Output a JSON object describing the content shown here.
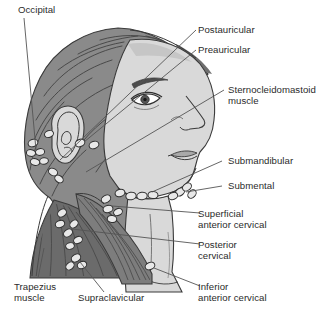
{
  "figure": {
    "background_color": "#ffffff",
    "text_color": "#2b2b2b"
  },
  "palette": {
    "hair_dark": "#6f6f6f",
    "hair_mid": "#8a8a8a",
    "skin": "#d9d9d9",
    "skin_shadow": "#c6c6c6",
    "muscle_dark": "#6b6b6b",
    "muscle_mid": "#7d7d7d",
    "node_fill": "#e8e8e8",
    "outline": "#3a3a3a",
    "leader_line": "#555555",
    "lip": "#a9a9a9",
    "white": "#ffffff"
  },
  "labels": [
    {
      "id": "occipital",
      "text": "Occipital",
      "lines": [
        "Occipital"
      ]
    },
    {
      "id": "postauricular",
      "text": "Postauricular",
      "lines": [
        "Postauricular"
      ]
    },
    {
      "id": "preauricular",
      "text": "Preauricular",
      "lines": [
        "Preauricular"
      ]
    },
    {
      "id": "sternocleidomastoid",
      "text": "Sternocleidomastoid muscle",
      "lines": [
        "Sternocleidomastoid",
        "muscle"
      ]
    },
    {
      "id": "submandibular",
      "text": "Submandibular",
      "lines": [
        "Submandibular"
      ]
    },
    {
      "id": "submental",
      "text": "Submental",
      "lines": [
        "Submental"
      ]
    },
    {
      "id": "superficial-anterior-cervical",
      "text": "Superficial anterior cervical",
      "lines": [
        "Superficial",
        "anterior cervical"
      ]
    },
    {
      "id": "posterior-cervical",
      "text": "Posterior cervical",
      "lines": [
        "Posterior",
        "cervical"
      ]
    },
    {
      "id": "inferior-anterior-cervical",
      "text": "Inferior anterior cervical",
      "lines": [
        "Inferior",
        "anterior cervical"
      ]
    },
    {
      "id": "trapezius",
      "text": "Trapezius muscle",
      "lines": [
        "Trapezius",
        "muscle"
      ]
    },
    {
      "id": "supraclavicular",
      "text": "Supraclavicular",
      "lines": [
        "Supraclavicular"
      ]
    }
  ],
  "label_text": {
    "occipital": "Occipital",
    "postauricular": "Postauricular",
    "preauricular": "Preauricular",
    "sternocleidomastoid_1": "Sternocleidomastoid",
    "sternocleidomastoid_2": "muscle",
    "submandibular": "Submandibular",
    "submental": "Submental",
    "superficial_anterior_cervical_1": "Superficial",
    "superficial_anterior_cervical_2": "anterior cervical",
    "posterior_cervical_1": "Posterior",
    "posterior_cervical_2": "cervical",
    "inferior_anterior_cervical_1": "Inferior",
    "inferior_anterior_cervical_2": "anterior cervical",
    "trapezius_1": "Trapezius",
    "trapezius_2": "muscle",
    "supraclavicular": "Supraclavicular"
  },
  "node_groups": [
    {
      "id": "occipital-nodes",
      "count": 5,
      "region": "behind-ear-lower-hairline"
    },
    {
      "id": "postauricular-nodes",
      "count": 2,
      "region": "behind-ear"
    },
    {
      "id": "preauricular-nodes",
      "count": 3,
      "region": "front-of-ear"
    },
    {
      "id": "submandibular-nodes",
      "count": 4,
      "region": "under-jaw"
    },
    {
      "id": "submental-nodes",
      "count": 4,
      "region": "under-chin"
    },
    {
      "id": "superficial-anterior-cervical-nodes",
      "count": 4,
      "region": "anterior-neck"
    },
    {
      "id": "posterior-cervical-nodes",
      "count": 6,
      "region": "posterior-neck"
    },
    {
      "id": "supraclavicular-nodes",
      "count": 3,
      "region": "above-clavicle"
    },
    {
      "id": "inferior-anterior-cervical-nodes",
      "count": 1,
      "region": "lower-anterior-neck"
    }
  ]
}
